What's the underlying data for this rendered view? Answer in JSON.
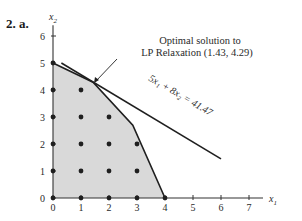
{
  "heading": "2. a.",
  "axes": {
    "x_label": "x",
    "x_sub": "1",
    "y_label": "x",
    "y_sub": "2",
    "x_ticks": [
      "0",
      "1",
      "2",
      "3",
      "4",
      "5",
      "6",
      "7"
    ],
    "y_ticks": [
      "0",
      "1",
      "2",
      "3",
      "4",
      "5",
      "6"
    ]
  },
  "annotation": {
    "line1": "Optimal solution to",
    "line2": "LP Relaxation (1.43, 4.29)"
  },
  "objective_line_label": "5x₁ + 8x₂ = 41.47",
  "colors": {
    "feasible_fill": "#d9d9d9",
    "line": "#1f1f1f",
    "point": "#1f1f1f"
  },
  "chart_data": {
    "type": "scatter",
    "title": "2. a.",
    "xlabel": "x1",
    "ylabel": "x2",
    "xlim": [
      0,
      7
    ],
    "ylim": [
      0,
      6
    ],
    "feasible_region_vertices": [
      [
        0,
        0
      ],
      [
        4,
        0
      ],
      [
        2.85,
        2.7
      ],
      [
        1.43,
        4.29
      ],
      [
        0,
        5
      ]
    ],
    "integer_points": [
      [
        0,
        0
      ],
      [
        1,
        0
      ],
      [
        2,
        0
      ],
      [
        3,
        0
      ],
      [
        4,
        0
      ],
      [
        0,
        1
      ],
      [
        1,
        1
      ],
      [
        2,
        1
      ],
      [
        3,
        1
      ],
      [
        0,
        2
      ],
      [
        1,
        2
      ],
      [
        2,
        2
      ],
      [
        3,
        2
      ],
      [
        0,
        3
      ],
      [
        1,
        3
      ],
      [
        2,
        3
      ],
      [
        0,
        4
      ],
      [
        1,
        4
      ],
      [
        0,
        5
      ]
    ],
    "objective_line": {
      "equation": "5x1 + 8x2 = 41.47",
      "from": [
        0.3,
        5.0
      ],
      "to": [
        6.0,
        1.45
      ]
    },
    "optimal_lp_solution": {
      "x1": 1.43,
      "x2": 4.29,
      "label": "Optimal solution to LP Relaxation (1.43, 4.29)"
    },
    "grid": false
  }
}
